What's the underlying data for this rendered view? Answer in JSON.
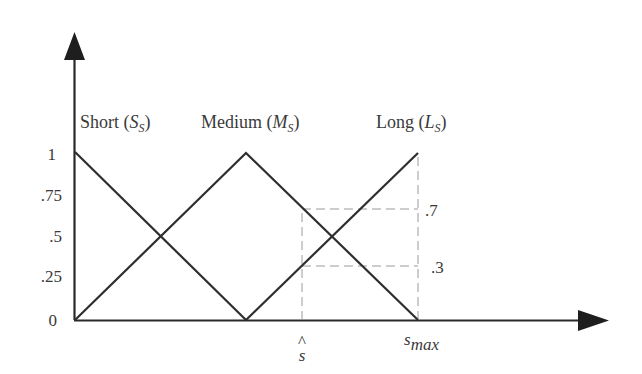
{
  "diagram": {
    "colors": {
      "line": "#2e2e2e",
      "axis": "#2a2a2a",
      "guide": "#9a9a9a",
      "text": "#3a3a3a",
      "background": "#ffffff"
    },
    "y_axis": {
      "ticks": [
        {
          "label": "1",
          "value": 1
        },
        {
          "label": ".75",
          "value": 0.75
        },
        {
          "label": ".5",
          "value": 0.5
        },
        {
          "label": ".25",
          "value": 0.25
        },
        {
          "label": "0",
          "value": 0
        }
      ]
    },
    "x_axis": {
      "marks": [
        {
          "name": "s-hat",
          "main": "s",
          "accent": "^"
        },
        {
          "name": "s-max",
          "main": "s",
          "sub": "max"
        }
      ]
    },
    "sets": [
      {
        "name": "Short",
        "symbol": "S",
        "sub": "S",
        "shape": "decreasing",
        "points": [
          [
            0,
            1
          ],
          [
            0.5,
            0
          ]
        ]
      },
      {
        "name": "Medium",
        "symbol": "M",
        "sub": "S",
        "shape": "triangle",
        "points": [
          [
            0,
            0
          ],
          [
            0.5,
            1
          ],
          [
            1.0,
            0
          ]
        ]
      },
      {
        "name": "Long",
        "symbol": "L",
        "sub": "S",
        "shape": "increasing",
        "points": [
          [
            0.5,
            0
          ],
          [
            1.0,
            1
          ]
        ]
      }
    ],
    "membership_readouts": [
      {
        "label": ".7",
        "value": 0.7
      },
      {
        "label": ".3",
        "value": 0.3
      }
    ]
  }
}
